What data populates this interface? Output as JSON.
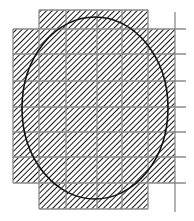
{
  "diagram": {
    "colors": {
      "hatch": "#1a1a1a",
      "grid": "#8a8a8a",
      "ellipse": "#111111",
      "background": "#ffffff"
    },
    "grid": {
      "columns_x": [
        13,
        39,
        66,
        97,
        122,
        148,
        175
      ],
      "rows_y": [
        10,
        29,
        54,
        81,
        107,
        132,
        157,
        183,
        209
      ]
    },
    "hatched_rows": [
      {
        "y0": 10,
        "y1": 29,
        "x0": 39,
        "x1": 148
      },
      {
        "y0": 29,
        "y1": 54,
        "x0": 13,
        "x1": 175
      },
      {
        "y0": 54,
        "y1": 81,
        "x0": 13,
        "x1": 175
      },
      {
        "y0": 81,
        "y1": 107,
        "x0": 13,
        "x1": 175
      },
      {
        "y0": 107,
        "y1": 132,
        "x0": 13,
        "x1": 175
      },
      {
        "y0": 132,
        "y1": 157,
        "x0": 13,
        "x1": 175
      },
      {
        "y0": 157,
        "y1": 183,
        "x0": 13,
        "x1": 175
      },
      {
        "y0": 183,
        "y1": 209,
        "x0": 39,
        "x1": 148
      }
    ],
    "ellipse": {
      "cx": 95,
      "cy": 108,
      "rx": 73,
      "ry": 91
    },
    "extension_lines": {
      "right_vertical": {
        "x": 175,
        "y0": 12,
        "y1": 212
      },
      "horizontal_right_x": 186
    }
  }
}
